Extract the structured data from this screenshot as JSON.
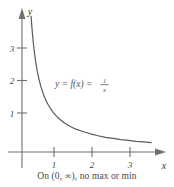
{
  "figure": {
    "caption": "On (0, ∞), no max or min",
    "curve_label": {
      "lead": "y = f(x) = ",
      "numerator": "1",
      "denominator": "x"
    },
    "axis_labels": {
      "x": "x",
      "y": "y"
    },
    "colors": {
      "background": "#ffffff",
      "axis": "#6f6f6f",
      "curve": "#5a5a5a",
      "text": "#4a4a4a"
    }
  },
  "chart_data": {
    "type": "line",
    "title": "",
    "subtitle": "",
    "xlabel": "x",
    "ylabel": "y",
    "function": "y = f(x) = 1/x",
    "xlim": [
      0,
      3.65
    ],
    "ylim": [
      0,
      4.2
    ],
    "xticks": [
      1,
      2,
      3
    ],
    "xtick_labels": [
      "1",
      "2",
      "3"
    ],
    "yticks": [
      1,
      2,
      3
    ],
    "ytick_labels": [
      "1",
      "2",
      "3"
    ],
    "grid": false,
    "legend": false,
    "annotations": [
      {
        "text": "y = f(x) = 1/x",
        "x": 1.45,
        "y": 2.05
      },
      {
        "text": "On (0, ∞), no max or min",
        "x": 1.8,
        "y": -0.7
      }
    ],
    "series": [
      {
        "name": "f(x) = 1/x",
        "x": [
          0.24,
          0.26,
          0.28,
          0.3,
          0.33,
          0.36,
          0.4,
          0.45,
          0.5,
          0.55,
          0.6,
          0.65,
          0.7,
          0.8,
          0.9,
          1.0,
          1.1,
          1.2,
          1.4,
          1.6,
          1.8,
          2.0,
          2.2,
          2.4,
          2.6,
          2.8,
          3.0,
          3.2,
          3.4
        ],
        "y": [
          4.17,
          3.85,
          3.57,
          3.33,
          3.03,
          2.78,
          2.5,
          2.22,
          2.0,
          1.82,
          1.67,
          1.54,
          1.43,
          1.25,
          1.11,
          1.0,
          0.91,
          0.83,
          0.71,
          0.63,
          0.56,
          0.5,
          0.45,
          0.42,
          0.38,
          0.36,
          0.33,
          0.31,
          0.29
        ]
      }
    ]
  }
}
